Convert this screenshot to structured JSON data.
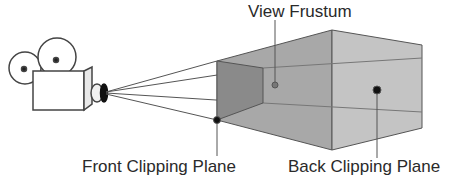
{
  "diagram": {
    "labels": {
      "view_frustum": "View Frustum",
      "front_clipping_plane": "Front Clipping Plane",
      "back_clipping_plane": "Back Clipping Plane"
    },
    "elements": [
      "camera-icon",
      "projection-rays",
      "front-clipping-plane",
      "view-frustum-volume",
      "back-clipping-plane"
    ],
    "colors": {
      "stroke": "#555555",
      "front_plane_fill": "#8a8a8a",
      "frustum_fill": "#a8a8a8",
      "back_plane_fill": "#c4c4c4"
    }
  }
}
